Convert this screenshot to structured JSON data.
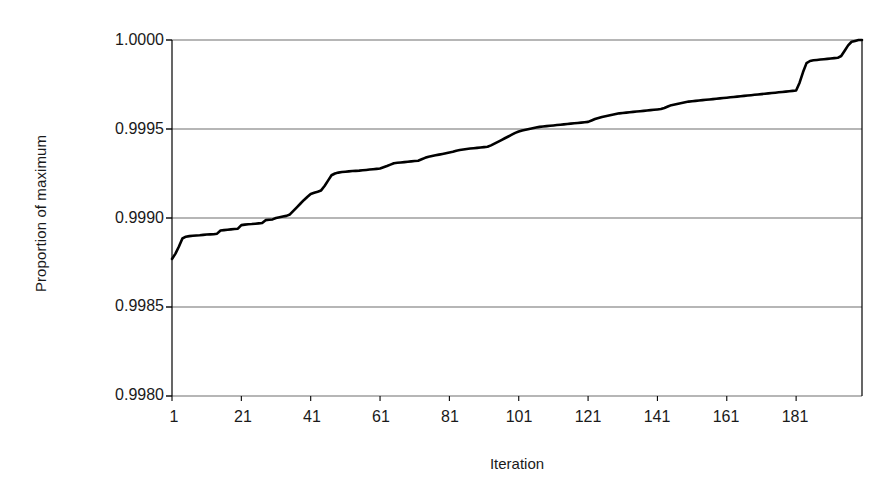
{
  "chart_data": {
    "type": "line",
    "title": "",
    "subtitle": "",
    "xlabel": "Iteration",
    "ylabel": "Proportion of maximum",
    "xlim": [
      1,
      200
    ],
    "ylim": [
      0.998,
      1.0
    ],
    "grid": true,
    "legend": null,
    "x_ticks": [
      1,
      21,
      41,
      61,
      81,
      101,
      121,
      141,
      161,
      181
    ],
    "x_tick_labels": [
      "1",
      "21",
      "41",
      "61",
      "81",
      "101",
      "121",
      "141",
      "161",
      "181"
    ],
    "y_ticks": [
      0.998,
      0.9985,
      0.999,
      0.9995,
      1.0
    ],
    "y_tick_labels": [
      "0.9980",
      "0.9985",
      "0.9990",
      "0.9995",
      "1.0000"
    ],
    "series": [
      {
        "name": "Proportion of maximum",
        "color": "#000000",
        "line_width": 2.6,
        "x": [
          1,
          2,
          3,
          4,
          5,
          6,
          7,
          8,
          9,
          10,
          11,
          12,
          13,
          14,
          15,
          16,
          17,
          18,
          19,
          20,
          21,
          22,
          23,
          24,
          25,
          26,
          27,
          28,
          29,
          30,
          31,
          32,
          33,
          34,
          35,
          36,
          37,
          38,
          39,
          40,
          41,
          42,
          43,
          44,
          45,
          46,
          47,
          48,
          49,
          50,
          51,
          52,
          53,
          54,
          55,
          56,
          57,
          58,
          59,
          60,
          61,
          62,
          63,
          64,
          65,
          66,
          67,
          68,
          69,
          70,
          71,
          72,
          73,
          74,
          75,
          76,
          77,
          78,
          79,
          80,
          81,
          82,
          83,
          84,
          85,
          86,
          87,
          88,
          89,
          90,
          91,
          92,
          93,
          94,
          95,
          96,
          97,
          98,
          99,
          100,
          101,
          102,
          103,
          104,
          105,
          106,
          107,
          108,
          109,
          110,
          111,
          112,
          113,
          114,
          115,
          116,
          117,
          118,
          119,
          120,
          121,
          122,
          123,
          124,
          125,
          126,
          127,
          128,
          129,
          130,
          131,
          132,
          133,
          134,
          135,
          136,
          137,
          138,
          139,
          140,
          141,
          142,
          143,
          144,
          145,
          146,
          147,
          148,
          149,
          150,
          151,
          152,
          153,
          154,
          155,
          156,
          157,
          158,
          159,
          160,
          161,
          162,
          163,
          164,
          165,
          166,
          167,
          168,
          169,
          170,
          171,
          172,
          173,
          174,
          175,
          176,
          177,
          178,
          179,
          180,
          181,
          182,
          183,
          184,
          185,
          186,
          187,
          188,
          189,
          190,
          191,
          192,
          193,
          194,
          195,
          196,
          197,
          198,
          199,
          200
        ],
        "y": [
          0.99877,
          0.9988,
          0.99884,
          0.998885,
          0.998895,
          0.998898,
          0.9989,
          0.998902,
          0.998903,
          0.998905,
          0.998907,
          0.998908,
          0.998909,
          0.998912,
          0.99893,
          0.998932,
          0.998934,
          0.998936,
          0.998938,
          0.99894,
          0.99896,
          0.998963,
          0.998965,
          0.998966,
          0.998968,
          0.99897,
          0.998972,
          0.998988,
          0.99899,
          0.998992,
          0.999,
          0.999004,
          0.999008,
          0.999012,
          0.99902,
          0.99904,
          0.99906,
          0.99908,
          0.9991,
          0.999118,
          0.999135,
          0.999142,
          0.999148,
          0.999155,
          0.99918,
          0.99921,
          0.99924,
          0.99925,
          0.999255,
          0.999258,
          0.99926,
          0.999262,
          0.999264,
          0.999265,
          0.999266,
          0.999268,
          0.99927,
          0.999272,
          0.999274,
          0.999276,
          0.999278,
          0.999285,
          0.999292,
          0.9993,
          0.999308,
          0.99931,
          0.999312,
          0.999314,
          0.999316,
          0.999318,
          0.99932,
          0.999322,
          0.99933,
          0.999338,
          0.999344,
          0.999348,
          0.999352,
          0.999356,
          0.99936,
          0.999364,
          0.999368,
          0.999372,
          0.999378,
          0.999382,
          0.999385,
          0.999388,
          0.99939,
          0.999392,
          0.999394,
          0.999396,
          0.999398,
          0.9994,
          0.999408,
          0.999418,
          0.999428,
          0.999438,
          0.999448,
          0.999458,
          0.999468,
          0.999478,
          0.999486,
          0.999492,
          0.999496,
          0.9995,
          0.999504,
          0.999508,
          0.999512,
          0.999514,
          0.999516,
          0.999518,
          0.99952,
          0.999522,
          0.999524,
          0.999526,
          0.999528,
          0.99953,
          0.999532,
          0.999534,
          0.999536,
          0.999538,
          0.99954,
          0.999548,
          0.999556,
          0.999562,
          0.999568,
          0.999572,
          0.999576,
          0.99958,
          0.999584,
          0.999588,
          0.99959,
          0.999592,
          0.999594,
          0.999596,
          0.999598,
          0.9996,
          0.999602,
          0.999604,
          0.999606,
          0.999608,
          0.99961,
          0.999612,
          0.999618,
          0.999626,
          0.999634,
          0.999638,
          0.999642,
          0.999646,
          0.99965,
          0.999654,
          0.999656,
          0.999658,
          0.99966,
          0.999662,
          0.999664,
          0.999666,
          0.999668,
          0.99967,
          0.999672,
          0.999674,
          0.999676,
          0.999678,
          0.99968,
          0.999682,
          0.999684,
          0.999686,
          0.999688,
          0.99969,
          0.999692,
          0.999694,
          0.999696,
          0.999698,
          0.9997,
          0.999702,
          0.999704,
          0.999706,
          0.999708,
          0.99971,
          0.999712,
          0.999714,
          0.999716,
          0.99976,
          0.99982,
          0.99987,
          0.999882,
          0.999886,
          0.999888,
          0.99989,
          0.999892,
          0.999894,
          0.999896,
          0.999898,
          0.9999,
          0.99991,
          0.99994,
          0.99997,
          0.99999,
          0.999995,
          1.0,
          1.0
        ]
      }
    ]
  },
  "axes": {
    "frame_color": "#000000",
    "grid_color": "#6e6e6e",
    "background": "#ffffff"
  }
}
